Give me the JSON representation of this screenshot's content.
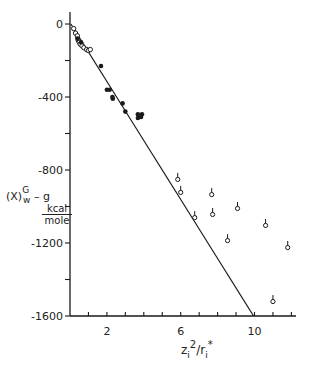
{
  "chart_data": {
    "type": "scatter",
    "title": "",
    "xlabel": "z_i^2 / r_i^*",
    "ylabel": "(X)_w^G - g, kcal/mole",
    "ylabel_parts": {
      "main": "(X)",
      "sup": "G",
      "sub": "w",
      "suffix": "– g",
      "unit_num": "kcal",
      "unit_den": "mole"
    },
    "xlabel_parts": {
      "main": "z",
      "sub": "i",
      "sup": "2",
      "rest": "/r",
      "sub2": "i",
      "sup2": "*"
    },
    "xlim": [
      0,
      12.2
    ],
    "ylim": [
      -1600,
      50
    ],
    "x_ticks": [
      1,
      2,
      3,
      4,
      5,
      6,
      7,
      8,
      9,
      10,
      11,
      12
    ],
    "x_tick_labels": [
      {
        "value": 2,
        "label": "2"
      },
      {
        "value": 6,
        "label": "6"
      },
      {
        "value": 10,
        "label": "10"
      }
    ],
    "y_ticks": [
      0,
      -200,
      -400,
      -600,
      -800,
      -1000,
      -1200,
      -1400,
      -1600
    ],
    "y_tick_labels": [
      {
        "value": 0,
        "label": "0"
      },
      {
        "value": -400,
        "label": "-400"
      },
      {
        "value": -800,
        "label": "-800"
      },
      {
        "value": -1200,
        "label": "-1200"
      },
      {
        "value": -1600,
        "label": "-1600"
      }
    ],
    "grid": false,
    "legend": null,
    "series": [
      {
        "name": "open circles (low z²/r)",
        "marker": "open-circle",
        "points": [
          [
            0.2,
            -25
          ],
          [
            0.3,
            -50
          ],
          [
            0.4,
            -65
          ],
          [
            0.45,
            -90
          ],
          [
            0.5,
            -100
          ],
          [
            0.55,
            -110
          ],
          [
            0.65,
            -120
          ],
          [
            0.75,
            -130
          ],
          [
            0.9,
            -140
          ],
          [
            1.0,
            -145
          ],
          [
            1.1,
            -140
          ]
        ]
      },
      {
        "name": "filled circles",
        "marker": "filled-circle",
        "points": [
          [
            0.4,
            -80
          ],
          [
            0.6,
            -100
          ],
          [
            1.68,
            -230
          ],
          [
            2.0,
            -360
          ],
          [
            2.15,
            -360
          ],
          [
            2.3,
            -400
          ],
          [
            2.32,
            -410
          ],
          [
            2.85,
            -435
          ],
          [
            3.0,
            -480
          ],
          [
            3.68,
            -495
          ],
          [
            3.9,
            -495
          ],
          [
            3.68,
            -515
          ],
          [
            3.85,
            -510
          ]
        ]
      },
      {
        "name": "flagged open circles (high z²/r)",
        "marker": "flagged-open-circle",
        "points": [
          [
            5.84,
            -849
          ],
          [
            6.0,
            -920
          ],
          [
            6.76,
            -1058
          ],
          [
            7.68,
            -932
          ],
          [
            7.73,
            -1041
          ],
          [
            8.54,
            -1184
          ],
          [
            9.08,
            -1008
          ],
          [
            10.6,
            -1101
          ],
          [
            11.0,
            -1518
          ],
          [
            11.8,
            -1222
          ]
        ]
      }
    ],
    "fit_line": {
      "from": [
        0.05,
        0
      ],
      "to": [
        9.95,
        -1600
      ]
    }
  }
}
